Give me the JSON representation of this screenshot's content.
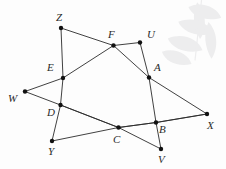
{
  "figure": {
    "kind": "geometry-line-diagram",
    "width": 226,
    "height": 169,
    "background_color": "#fdfdfd",
    "line_color": "#2b2b2b",
    "dot_color": "#111111",
    "label_color": "#2a2a2a",
    "vertices": [
      {
        "id": "Z",
        "label": "Z",
        "x": 61,
        "y": 28,
        "label_x": 56,
        "label_y": 12
      },
      {
        "id": "F",
        "label": "F",
        "x": 113.5,
        "y": 45.5,
        "label_x": 108,
        "label_y": 29
      },
      {
        "id": "U",
        "label": "U",
        "x": 140,
        "y": 42.5,
        "label_x": 147,
        "label_y": 29
      },
      {
        "id": "E",
        "label": "E",
        "x": 63,
        "y": 78,
        "label_x": 47,
        "label_y": 62
      },
      {
        "id": "A",
        "label": "A",
        "x": 149,
        "y": 77.5,
        "label_x": 154,
        "label_y": 62
      },
      {
        "id": "W",
        "label": "W",
        "x": 25,
        "y": 91.5,
        "label_x": 8,
        "label_y": 93
      },
      {
        "id": "D",
        "label": "D",
        "x": 60.5,
        "y": 105,
        "label_x": 47,
        "label_y": 107
      },
      {
        "id": "X",
        "label": "X",
        "x": 207,
        "y": 114,
        "label_x": 207,
        "label_y": 120
      },
      {
        "id": "B",
        "label": "B",
        "x": 156,
        "y": 122.5,
        "label_x": 159,
        "label_y": 124
      },
      {
        "id": "C",
        "label": "C",
        "x": 118.5,
        "y": 127.5,
        "label_x": 113,
        "label_y": 134
      },
      {
        "id": "Y",
        "label": "Y",
        "x": 52,
        "y": 141,
        "label_x": 48,
        "label_y": 146
      },
      {
        "id": "V",
        "label": "V",
        "x": 161,
        "y": 149,
        "label_x": 158,
        "label_y": 154
      }
    ],
    "lines": [
      {
        "name": "line-w-e-f-u",
        "points": [
          "W",
          "E",
          "F",
          "U"
        ]
      },
      {
        "name": "line-w-d-c-b-x",
        "points": [
          "W",
          "D",
          "C",
          "B",
          "X"
        ]
      },
      {
        "name": "line-z-e-d-y",
        "points": [
          "Z",
          "E",
          "D",
          "Y"
        ]
      },
      {
        "name": "line-z-f-a-x",
        "points": [
          "Z",
          "F",
          "A",
          "X"
        ]
      },
      {
        "name": "line-u-a-b-v",
        "points": [
          "U",
          "A",
          "B",
          "V"
        ]
      },
      {
        "name": "line-y-c-b-x",
        "points": [
          "Y",
          "C",
          "B",
          "X"
        ]
      },
      {
        "name": "line-d-c-v",
        "points": [
          "D",
          "C",
          "V"
        ]
      }
    ],
    "watermark": {
      "name": "leaf-watermark",
      "color": "#ededee",
      "x": 168,
      "y": -6
    }
  }
}
